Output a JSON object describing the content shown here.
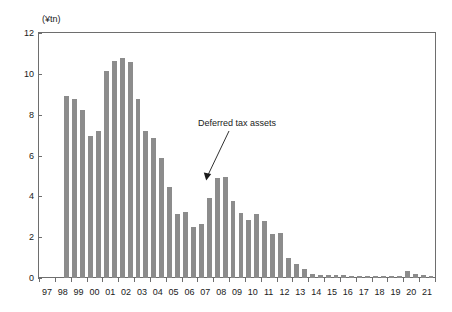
{
  "chart_data": {
    "type": "bar",
    "title": "",
    "subtitle": "",
    "xlabel": "",
    "ylabel": "",
    "y_unit_label": "(¥tn)",
    "ylim": [
      0,
      12
    ],
    "y_ticks": [
      0,
      2,
      4,
      6,
      8,
      10,
      12
    ],
    "grid": false,
    "legend": "none",
    "bar_color": "#8c8c8c",
    "axis_color": "#6e6e6e",
    "text_color": "#1a1a1a",
    "x_tick_labels": [
      "97",
      "98",
      "99",
      "00",
      "01",
      "02",
      "03",
      "04",
      "05",
      "06",
      "07",
      "08",
      "09",
      "10",
      "11",
      "12",
      "13",
      "14",
      "15",
      "16",
      "17",
      "18",
      "19",
      "20",
      "21"
    ],
    "series_name": "Deferred tax assets",
    "annotations": [
      {
        "text": "Deferred tax assets",
        "points_to_category": "08H2",
        "points_to_value": 4.95
      }
    ],
    "categories": [
      "97H1",
      "97H2",
      "98H1",
      "98H2",
      "99H1",
      "99H2",
      "00H1",
      "00H2",
      "01H1",
      "01H2",
      "02H1",
      "02H2",
      "03H1",
      "03H2",
      "04H1",
      "04H2",
      "05H1",
      "05H2",
      "06H1",
      "06H2",
      "07H1",
      "07H2",
      "08H1",
      "08H2",
      "09H1",
      "09H2",
      "10H1",
      "10H2",
      "11H1",
      "11H2",
      "12H1",
      "12H2",
      "13H1",
      "13H2",
      "14H1",
      "14H2",
      "15H1",
      "15H2",
      "16H1",
      "16H2",
      "17H1",
      "17H2",
      "18H1",
      "18H2",
      "19H1",
      "19H2",
      "20H1",
      "20H2",
      "21H1",
      "21H2"
    ],
    "values": [
      0,
      0,
      0,
      8.9,
      8.75,
      8.22,
      6.98,
      7.22,
      10.12,
      10.62,
      10.76,
      10.56,
      8.76,
      7.22,
      6.88,
      5.86,
      4.45,
      3.13,
      3.23,
      2.48,
      2.66,
      3.9,
      4.92,
      4.95,
      3.76,
      3.16,
      2.82,
      3.12,
      2.8,
      2.15,
      2.2,
      0.96,
      0.7,
      0.46,
      0.2,
      0.13,
      0.14,
      0.13,
      0.13,
      0.12,
      0.12,
      0.11,
      0.12,
      0.1,
      0.1,
      0.12,
      0.32,
      0.18,
      0.15,
      0.12
    ]
  }
}
